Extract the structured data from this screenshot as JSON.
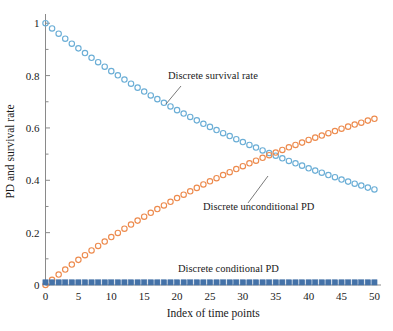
{
  "chart_data": {
    "type": "scatter",
    "title": "",
    "xlabel": "Index of time points",
    "ylabel": "PD and survival rate",
    "xlim": [
      0,
      51
    ],
    "ylim": [
      0,
      1.02
    ],
    "grid": false,
    "legend_position": "inline-annotations",
    "x_ticks": [
      "0",
      "5",
      "10",
      "15",
      "20",
      "25",
      "30",
      "35",
      "40",
      "45",
      "50"
    ],
    "x_tick_values": [
      0,
      5,
      10,
      15,
      20,
      25,
      30,
      35,
      40,
      45,
      50
    ],
    "y_ticks": [
      "0",
      "0.2",
      "0.4",
      "0.6",
      "0.8",
      "1"
    ],
    "y_tick_values": [
      0,
      0.2,
      0.4,
      0.6,
      0.8,
      1
    ],
    "y_minor_tick_values": [
      0.1,
      0.3,
      0.5,
      0.7,
      0.9
    ],
    "x": [
      0,
      1,
      2,
      3,
      4,
      5,
      6,
      7,
      8,
      9,
      10,
      11,
      12,
      13,
      14,
      15,
      16,
      17,
      18,
      19,
      20,
      21,
      22,
      23,
      24,
      25,
      26,
      27,
      28,
      29,
      30,
      31,
      32,
      33,
      34,
      35,
      36,
      37,
      38,
      39,
      40,
      41,
      42,
      43,
      44,
      45,
      46,
      47,
      48,
      49,
      50
    ],
    "series": [
      {
        "name": "Discrete survival rate",
        "color": "#6BAED6",
        "marker": "open-circle",
        "values": [
          1.0,
          0.98,
          0.96,
          0.941,
          0.922,
          0.904,
          0.886,
          0.868,
          0.851,
          0.834,
          0.817,
          0.801,
          0.785,
          0.769,
          0.754,
          0.739,
          0.724,
          0.71,
          0.696,
          0.682,
          0.668,
          0.655,
          0.642,
          0.629,
          0.616,
          0.604,
          0.592,
          0.58,
          0.569,
          0.557,
          0.546,
          0.535,
          0.525,
          0.514,
          0.504,
          0.494,
          0.484,
          0.474,
          0.465,
          0.456,
          0.446,
          0.437,
          0.429,
          0.42,
          0.412,
          0.403,
          0.395,
          0.387,
          0.38,
          0.372,
          0.365
        ]
      },
      {
        "name": "Discrete unconditional PD",
        "color": "#ED8B4E",
        "marker": "open-circle",
        "values": [
          0.0,
          0.02,
          0.04,
          0.059,
          0.078,
          0.096,
          0.114,
          0.132,
          0.149,
          0.166,
          0.183,
          0.199,
          0.215,
          0.231,
          0.246,
          0.261,
          0.276,
          0.29,
          0.304,
          0.318,
          0.332,
          0.345,
          0.358,
          0.371,
          0.384,
          0.396,
          0.408,
          0.42,
          0.431,
          0.443,
          0.454,
          0.465,
          0.475,
          0.486,
          0.496,
          0.506,
          0.516,
          0.526,
          0.535,
          0.544,
          0.554,
          0.563,
          0.571,
          0.58,
          0.588,
          0.597,
          0.605,
          0.613,
          0.62,
          0.628,
          0.635
        ]
      },
      {
        "name": "Discrete conditional PD",
        "color": "#4472A8",
        "marker": "filled-square",
        "values": [
          0.01,
          0.01,
          0.01,
          0.01,
          0.01,
          0.01,
          0.01,
          0.01,
          0.01,
          0.01,
          0.01,
          0.01,
          0.01,
          0.01,
          0.01,
          0.01,
          0.01,
          0.01,
          0.01,
          0.01,
          0.01,
          0.01,
          0.01,
          0.01,
          0.01,
          0.01,
          0.01,
          0.01,
          0.01,
          0.01,
          0.01,
          0.01,
          0.01,
          0.01,
          0.01,
          0.01,
          0.01,
          0.01,
          0.01,
          0.01,
          0.01,
          0.01,
          0.01,
          0.01,
          0.01,
          0.01,
          0.01,
          0.01,
          0.01,
          0.01,
          0.01
        ]
      }
    ],
    "annotations": [
      {
        "text": "Discrete survival rate",
        "x_px": 168,
        "y_px": 79
      },
      {
        "text": "Discrete unconditional PD",
        "x_px": 203,
        "y_px": 210
      },
      {
        "text": "Discrete conditional PD",
        "x_px": 178,
        "y_px": 272
      }
    ]
  }
}
